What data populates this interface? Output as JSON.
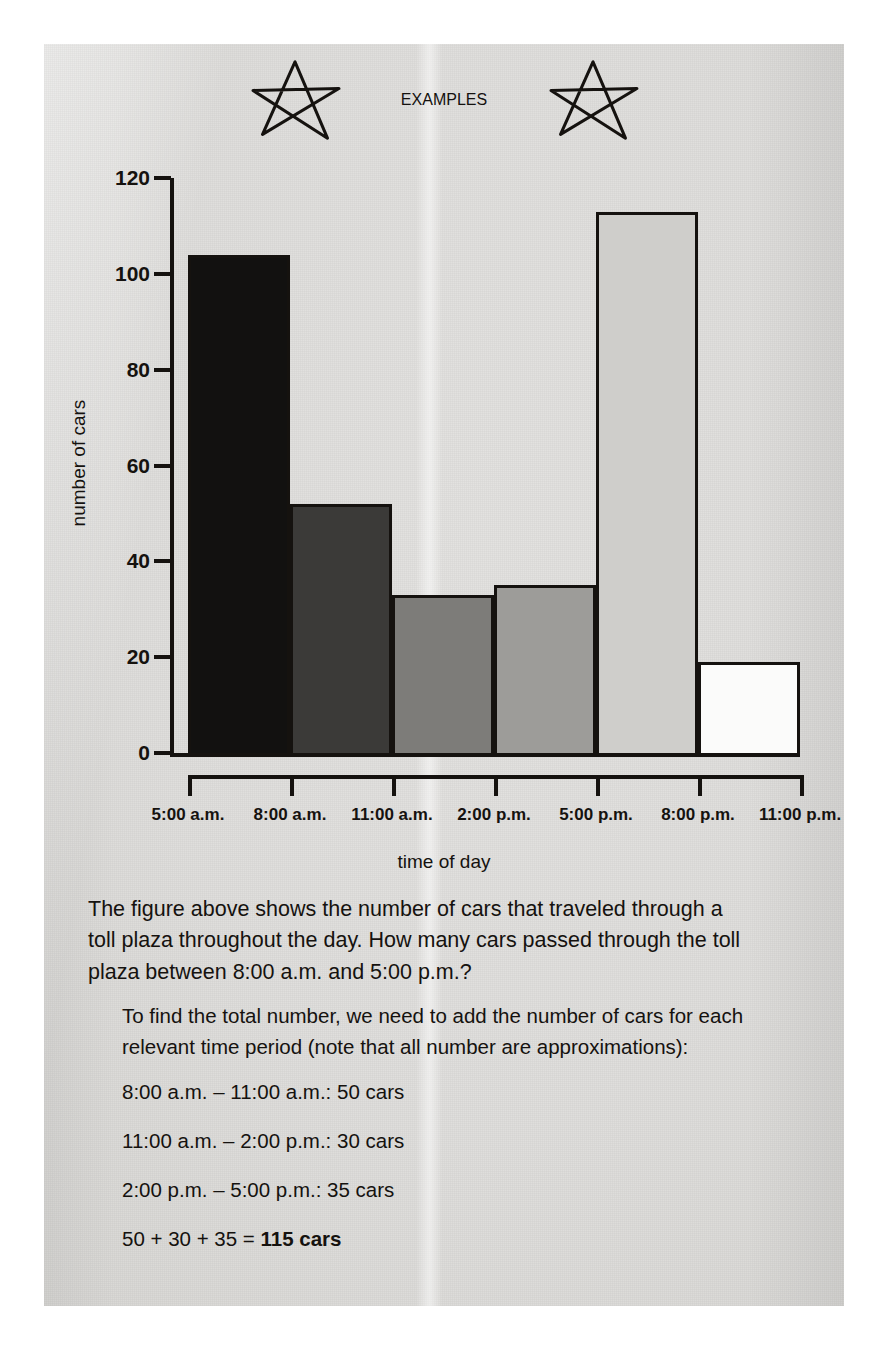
{
  "header": {
    "title": "EXAMPLES",
    "left_icon": "star-icon",
    "right_icon": "star-icon"
  },
  "chart_data": {
    "type": "bar",
    "title": "",
    "xlabel": "time of day",
    "ylabel": "number of cars",
    "categories": [
      "5:00 a.m. – 8:00 a.m.",
      "8:00 a.m. – 11:00 a.m.",
      "11:00 a.m. – 2:00 p.m.",
      "2:00 p.m. – 5:00 p.m.",
      "5:00 p.m. – 8:00 p.m.",
      "8:00 p.m. – 11:00 p.m."
    ],
    "values": [
      104,
      52,
      33,
      35,
      113,
      19
    ],
    "bar_colors": [
      "#121110",
      "#3b3a38",
      "#7d7c79",
      "#9d9c99",
      "#cfcecb",
      "#fbfbfa"
    ],
    "x_tick_labels": [
      "5:00 a.m.",
      "8:00 a.m.",
      "11:00 a.m.",
      "2:00 p.m.",
      "5:00 p.m.",
      "8:00 p.m.",
      "11:00 p.m."
    ],
    "y_tick_labels": [
      "0",
      "20",
      "40",
      "60",
      "80",
      "100",
      "120"
    ],
    "y_tick_values": [
      0,
      20,
      40,
      60,
      80,
      100,
      120
    ],
    "ylim": [
      0,
      120
    ],
    "grid": false,
    "legend": "none"
  },
  "question": {
    "text": "The figure above shows the number of cars that traveled through a toll plaza throughout the day. How many cars passed through the toll plaza between 8:00 a.m. and 5:00 p.m.?"
  },
  "solution": {
    "lead": "To find the total number, we need to add the number of cars for each relevant time period (note that all number are approximations):",
    "lines": [
      "8:00 a.m. – 11:00 a.m.: 50 cars",
      "11:00 a.m. – 2:00 p.m.: 30 cars",
      "2:00 p.m. – 5:00 p.m.: 35 cars"
    ],
    "total_expression": "50 + 30 + 35 = ",
    "total_answer": "115 cars"
  }
}
